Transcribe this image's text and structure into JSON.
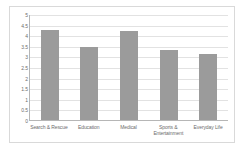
{
  "chart_data": {
    "type": "bar",
    "title": "",
    "xlabel": "",
    "ylabel": "",
    "categories": [
      "Search & Rescue",
      "Education",
      "Medical",
      "Sports & Entertainment",
      "Everyday Life"
    ],
    "values": [
      4.25,
      3.45,
      4.2,
      3.28,
      3.12
    ],
    "ylim": [
      0,
      5
    ],
    "ytick_step": 0.5,
    "yticks": [
      "5",
      "4.5",
      "4",
      "3.5",
      "3",
      "2.5",
      "2",
      "1.5",
      "1",
      "0.5",
      "0"
    ],
    "grid": true,
    "legend": false,
    "bar_color": "#9b9b9b",
    "gridline_color": "#e2e2e2",
    "axis_color": "#b6b6b6",
    "border_color": "#d9d9d9",
    "label_color": "#6d6d6d",
    "background": "#ffffff"
  }
}
